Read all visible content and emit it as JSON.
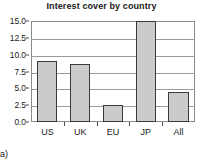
{
  "figure": {
    "panel_label": "(a)"
  },
  "chart_data": {
    "type": "bar",
    "title": "Interest cover by country",
    "xlabel": "",
    "ylabel": "",
    "categories": [
      "US",
      "UK",
      "EU",
      "JP",
      "All"
    ],
    "values": [
      9.1,
      8.6,
      2.5,
      15.1,
      4.4
    ],
    "ylim": [
      0.0,
      15.0
    ],
    "yticks": [
      "0.0",
      "2.5",
      "5.0",
      "7.5",
      "10.0",
      "12.5",
      "15.0"
    ],
    "ytick_values": [
      0.0,
      2.5,
      5.0,
      7.5,
      10.0,
      12.5,
      15.0
    ],
    "grid": true,
    "grid_orientation": "horizontal",
    "legend": false,
    "bar_fill_color": "#cbcbcb",
    "bar_edge_color": "#3a3a3a",
    "grid_color": "#9a9a9a",
    "frame_color": "#8c8c8c",
    "text_color": "#1a1a1a"
  }
}
